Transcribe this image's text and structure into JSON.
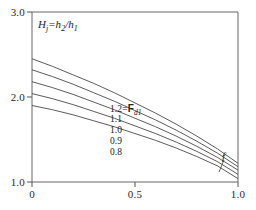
{
  "chart_data": {
    "type": "line",
    "title": "",
    "ylabel_inline": "Hj=h2/h1",
    "ylabel_parts": {
      "main1": "H",
      "sub1": "j",
      "equals": "=h",
      "sub2": "2",
      "slash": "/h",
      "sub3": "1"
    },
    "xlabel": "",
    "xlim": [
      0,
      1.0
    ],
    "ylim": [
      1.0,
      3.0
    ],
    "x_ticks": [
      "0",
      "0.5",
      "1.0"
    ],
    "x_tick_values": [
      0,
      0.5,
      1.0
    ],
    "y_ticks": [
      "1.0",
      "2.0",
      "3.0"
    ],
    "y_tick_values": [
      1.0,
      2.0,
      3.0
    ],
    "grid": false,
    "legend_position": "inline-curve-labels",
    "series_label_prefix": "F",
    "series_label_subscript": "d1",
    "series_label_suffix": "=Fd1",
    "annotation_f": "f",
    "x": [
      0,
      0.1,
      0.2,
      0.3,
      0.4,
      0.5,
      0.6,
      0.7,
      0.8,
      0.9,
      1.0
    ],
    "series": [
      {
        "name": "1.2",
        "label": "1.2",
        "values": [
          2.45,
          2.36,
          2.26,
          2.16,
          2.05,
          1.93,
          1.81,
          1.68,
          1.54,
          1.39,
          1.22
        ]
      },
      {
        "name": "1.1",
        "label": "1.1",
        "values": [
          2.32,
          2.24,
          2.15,
          2.05,
          1.95,
          1.84,
          1.73,
          1.61,
          1.48,
          1.34,
          1.18
        ]
      },
      {
        "name": "1.0",
        "label": "1.0",
        "values": [
          2.18,
          2.11,
          2.03,
          1.94,
          1.85,
          1.75,
          1.65,
          1.54,
          1.42,
          1.29,
          1.14
        ]
      },
      {
        "name": "0.9",
        "label": "0.9",
        "values": [
          2.04,
          1.98,
          1.91,
          1.83,
          1.75,
          1.66,
          1.57,
          1.47,
          1.36,
          1.24,
          1.09
        ]
      },
      {
        "name": "0.8",
        "label": "0.8",
        "values": [
          1.9,
          1.85,
          1.79,
          1.72,
          1.65,
          1.57,
          1.49,
          1.4,
          1.3,
          1.19,
          1.04
        ]
      }
    ],
    "colors": {
      "axis": "#555555",
      "curve": "#4a4a4a",
      "text": "#222222",
      "background": "#ffffff"
    }
  },
  "axes": {
    "y_tick_1": "1.0",
    "y_tick_2": "2.0",
    "y_tick_3": "3.0",
    "x_tick_1": "0",
    "x_tick_2": "0.5",
    "x_tick_3": "1.0"
  },
  "curve_labels": {
    "c1": "1.2",
    "c1_suffix_main": "F",
    "c1_suffix_sub": "d1",
    "c2": "1.1",
    "c3": "1.0",
    "c4": "0.9",
    "c5": "0.8"
  },
  "annotations": {
    "f_marker": "f"
  }
}
